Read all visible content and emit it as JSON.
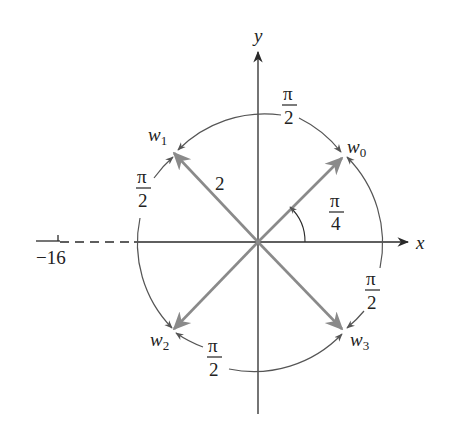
{
  "diagram": {
    "axes": {
      "x_label": "x",
      "y_label": "y",
      "tick_value": "−16"
    },
    "modulus_label": "2",
    "roots": [
      {
        "name": "w",
        "sub": "0",
        "angle": "π/4"
      },
      {
        "name": "w",
        "sub": "1",
        "angle": "3π/4"
      },
      {
        "name": "w",
        "sub": "2",
        "angle": "5π/4"
      },
      {
        "name": "w",
        "sub": "3",
        "angle": "7π/4"
      }
    ],
    "arc_labels": {
      "top": {
        "num": "π",
        "den": "2"
      },
      "left": {
        "num": "π",
        "den": "2"
      },
      "bottom": {
        "num": "π",
        "den": "2"
      },
      "right": {
        "num": "π",
        "den": "2"
      },
      "initial_angle": {
        "num": "π",
        "den": "4"
      }
    },
    "colors": {
      "axis": "#2a2a2a",
      "vector": "#8a8a8a",
      "arc": "#555555",
      "text": "#222222"
    }
  }
}
